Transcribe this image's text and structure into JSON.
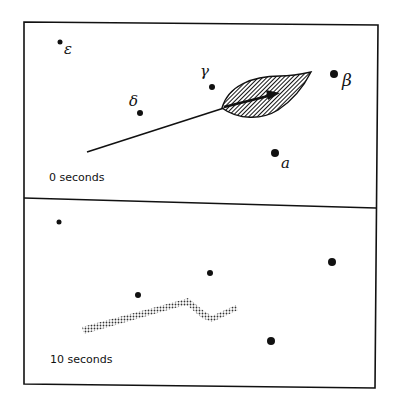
{
  "figure": {
    "panels": [
      {
        "id": "top",
        "time_label": "0 seconds",
        "points": [
          {
            "label": "ε",
            "x": 60,
            "y": 42,
            "r": 2.5
          },
          {
            "label": "γ",
            "x": 212,
            "y": 87,
            "r": 3
          },
          {
            "label": "δ",
            "x": 140,
            "y": 113,
            "r": 3
          },
          {
            "label": "β",
            "x": 334,
            "y": 74,
            "r": 4
          },
          {
            "label": "α",
            "x": 275,
            "y": 153,
            "r": 4
          }
        ],
        "shape": "hatched leaf with stem line",
        "leaf_color": "#2a2a2a"
      },
      {
        "id": "bottom",
        "time_label": "10 seconds",
        "points": [
          {
            "x": 59,
            "y": 222,
            "r": 2.5
          },
          {
            "x": 210,
            "y": 273,
            "r": 3
          },
          {
            "x": 138,
            "y": 295,
            "r": 3
          },
          {
            "x": 332,
            "y": 262,
            "r": 4
          },
          {
            "x": 271,
            "y": 341,
            "r": 4
          }
        ],
        "shape": "dotted stippled trail"
      }
    ],
    "labels": {
      "epsilon": "ε",
      "gamma": "γ",
      "delta": "δ",
      "beta": "β",
      "alpha": "a"
    },
    "line_color": "#111111",
    "background": "#ffffff"
  }
}
